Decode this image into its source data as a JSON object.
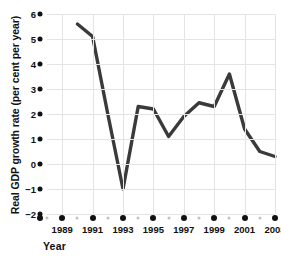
{
  "chart_data": {
    "type": "line",
    "title": "",
    "xlabel": "Year",
    "ylabel": "Real GDP growth rate (per cent per year)",
    "xlim": [
      1988,
      2003
    ],
    "ylim": [
      -2,
      6
    ],
    "grid": true,
    "legend": "none",
    "line_color": "#3a3a3a",
    "grid_color": "#e4e4e4",
    "tick_dot_color": "#111111",
    "minor_tick_dot_color": "#c2c2c2",
    "y_ticks": [
      6,
      5,
      4,
      3,
      2,
      1,
      0,
      -1,
      -2
    ],
    "y_tick_labels": [
      "6",
      "5",
      "4",
      "3",
      "2",
      "1",
      "0",
      "−1",
      "−2"
    ],
    "x_ticks_major": [
      1989,
      1991,
      1993,
      1995,
      1997,
      1999,
      2001,
      2003
    ],
    "x_tick_labels": [
      "1989",
      "1991",
      "1993",
      "1995",
      "1997",
      "1999",
      "2001",
      "2003"
    ],
    "x_ticks_minor": [
      1988,
      1990,
      1992,
      1994,
      1996,
      1998,
      2000,
      2002
    ],
    "x": [
      1990,
      1991,
      1992,
      1993,
      1994,
      1995,
      1996,
      1997,
      1998,
      1999,
      2000,
      2001,
      2002,
      2003
    ],
    "values": [
      5.6,
      5.1,
      2.0,
      -1.0,
      2.3,
      2.2,
      1.1,
      1.9,
      2.45,
      2.3,
      3.6,
      1.4,
      0.5,
      0.3
    ],
    "series": [
      {
        "name": "Real GDP growth rate",
        "values": [
          5.6,
          5.1,
          2.0,
          -1.0,
          2.3,
          2.2,
          1.1,
          1.9,
          2.45,
          2.3,
          3.6,
          1.4,
          0.5,
          0.3
        ]
      }
    ]
  }
}
